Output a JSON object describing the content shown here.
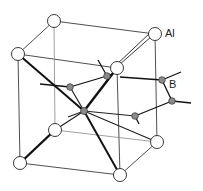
{
  "diagram": {
    "labels": {
      "al": "Al",
      "b": "B"
    },
    "colors": {
      "al_fill": "#ffffff",
      "b_fill": "#8a8a8a",
      "line": "#222222"
    },
    "al_atoms": [
      {
        "id": "top-back-left",
        "x": 54,
        "y": 21
      },
      {
        "id": "top-back-right",
        "x": 155,
        "y": 34
      },
      {
        "id": "top-front-left",
        "x": 18,
        "y": 54
      },
      {
        "id": "top-front-right",
        "x": 117,
        "y": 68
      },
      {
        "id": "bottom-back-left",
        "x": 55,
        "y": 130
      },
      {
        "id": "bottom-back-right",
        "x": 157,
        "y": 142
      },
      {
        "id": "bottom-front-left",
        "x": 20,
        "y": 163
      },
      {
        "id": "bottom-front-right",
        "x": 120,
        "y": 175
      }
    ],
    "b_atoms": [
      {
        "id": "center",
        "x": 84,
        "y": 111
      },
      {
        "id": "left",
        "x": 70,
        "y": 87
      },
      {
        "id": "upper",
        "x": 107,
        "y": 76
      },
      {
        "id": "right-upper",
        "x": 162,
        "y": 80
      },
      {
        "id": "right-lower",
        "x": 172,
        "y": 101
      },
      {
        "id": "front",
        "x": 135,
        "y": 116
      }
    ]
  }
}
